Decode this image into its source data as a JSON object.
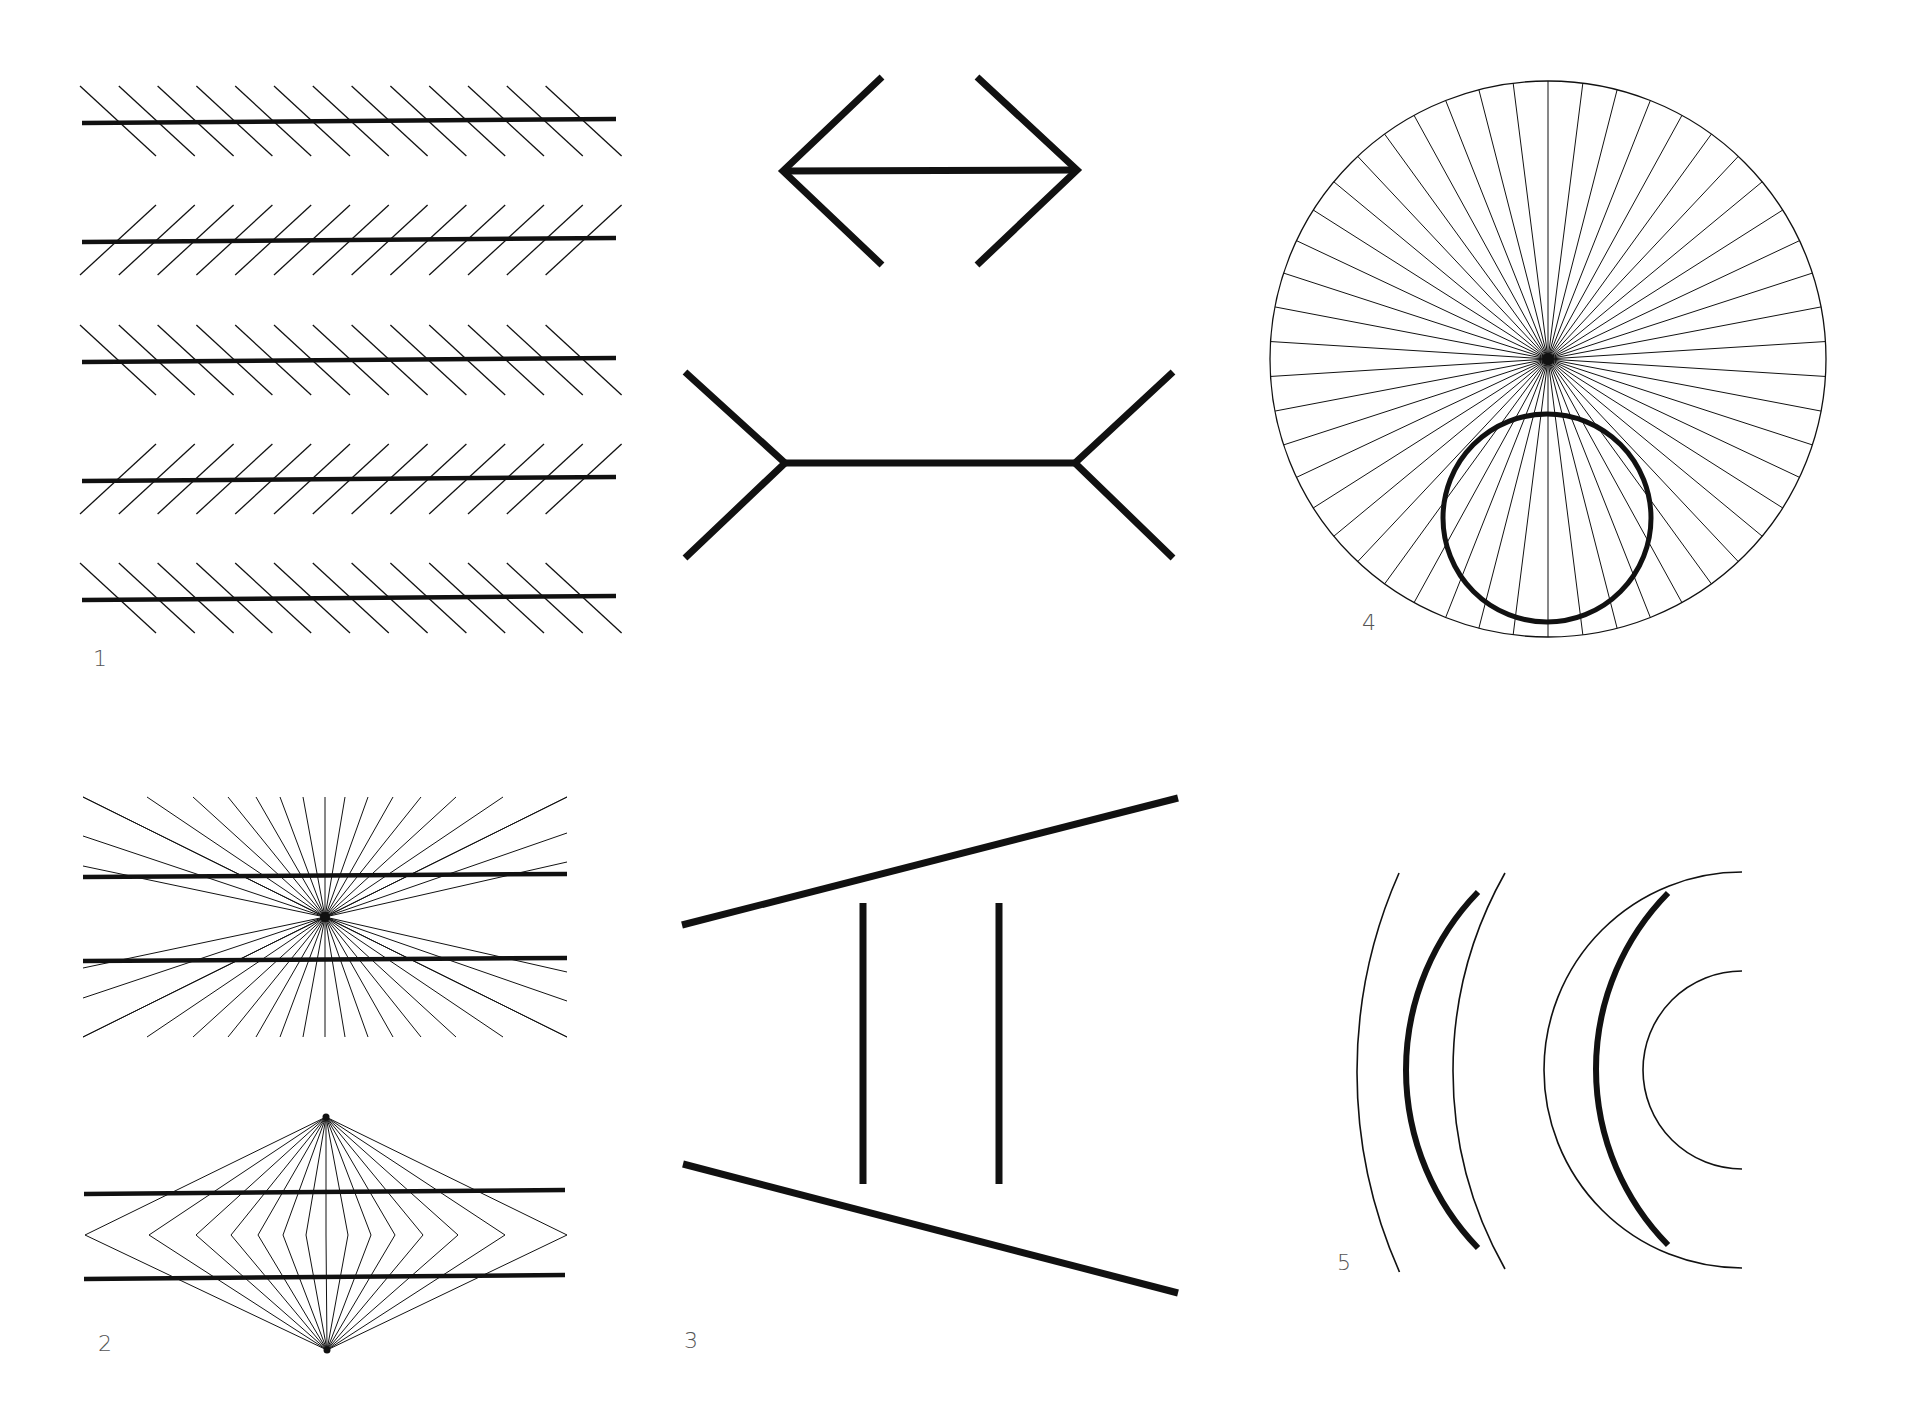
{
  "canvas": {
    "width": 1906,
    "height": 1406,
    "background": "#ffffff",
    "ink": "#111111"
  },
  "labels": [
    {
      "id": "fig1",
      "text": "1",
      "x": 93,
      "y": 648
    },
    {
      "id": "fig2",
      "text": "2",
      "x": 98,
      "y": 1333
    },
    {
      "id": "fig3",
      "text": "3",
      "x": 684,
      "y": 1330
    },
    {
      "id": "fig4",
      "text": "4",
      "x": 1362,
      "y": 612
    },
    {
      "id": "fig5",
      "text": "5",
      "x": 1337,
      "y": 1252
    }
  ],
  "figures": {
    "zollner": {
      "name": "Zöllner illusion",
      "x_start": 82,
      "x_end": 616,
      "lines_y": [
        121,
        240,
        360,
        479,
        598
      ],
      "hatch_orientation": [
        "down-right",
        "up-right",
        "down-right",
        "up-right",
        "down-right"
      ],
      "hatch_first_x": 118,
      "hatch_step": 38.8,
      "hatch_count": 13,
      "hatch_dx": 38,
      "hatch_dy": 35
    },
    "muller_lyer": {
      "name": "Müller-Lyer illusion",
      "top": {
        "left": [
          783,
          171
        ],
        "right": [
          1077,
          170
        ],
        "arm_x_left": 882,
        "arm_x_right": 977,
        "arm_y_top": 77,
        "arm_y_bottom": 265
      },
      "bottom": {
        "left": [
          785,
          463
        ],
        "right": [
          1075,
          463
        ],
        "arm_x_left": 685,
        "arm_x_right": 1173,
        "arm_y_top": 372,
        "arm_y_bottom": 558
      }
    },
    "hering": {
      "name": "Hering illusion",
      "center": [
        325,
        917
      ],
      "x_min": 83,
      "x_max": 567,
      "y_min": 797,
      "y_max": 1037,
      "thick_lines_y": [
        875,
        960
      ],
      "rays": 40
    },
    "wundt": {
      "name": "Wundt illusion",
      "top_vertex": [
        326,
        1117
      ],
      "bottom_vertex": [
        327,
        1350
      ],
      "mid_y": 1235,
      "bend_x": [
        85,
        149,
        196,
        231,
        258,
        283,
        306,
        326,
        348,
        371,
        395,
        423,
        458,
        505,
        567
      ],
      "thick_lines_y": [
        1192,
        1277
      ],
      "x_min": 84,
      "x_max": 565
    },
    "ponzo": {
      "name": "Ponzo illusion",
      "top_line": [
        [
          682,
          925
        ],
        [
          1178,
          798
        ]
      ],
      "bottom_line": [
        [
          683,
          1164
        ],
        [
          1178,
          1293
        ]
      ],
      "verticals_x": [
        863,
        999
      ],
      "vertical_y": [
        903,
        1184
      ]
    },
    "orbison": {
      "name": "Orbison / circle in radial lines",
      "center": [
        1548,
        359
      ],
      "radius": 278,
      "spokes": 50,
      "inner_circle": {
        "center": [
          1547,
          518
        ],
        "radius": 104
      }
    },
    "arcs": {
      "name": "Curvature contrast arcs",
      "thin_left": [
        {
          "cx": 1849,
          "cy": 1072,
          "r": 492,
          "y1": 873,
          "y2": 1272
        },
        {
          "cx": 1856,
          "cy": 1071,
          "r": 403,
          "y1": 873,
          "y2": 1269
        }
      ],
      "thick_a": {
        "cx": 1662,
        "cy": 1070,
        "r": 256,
        "y1": 892,
        "y2": 1248
      },
      "semicircles": {
        "cx": 1742,
        "cy": 1070,
        "r_outer": 198,
        "r_inner": 99
      },
      "thick_b": {
        "cx": 1847,
        "cy": 1069,
        "r": 251,
        "y1": 893,
        "y2": 1245
      }
    }
  }
}
